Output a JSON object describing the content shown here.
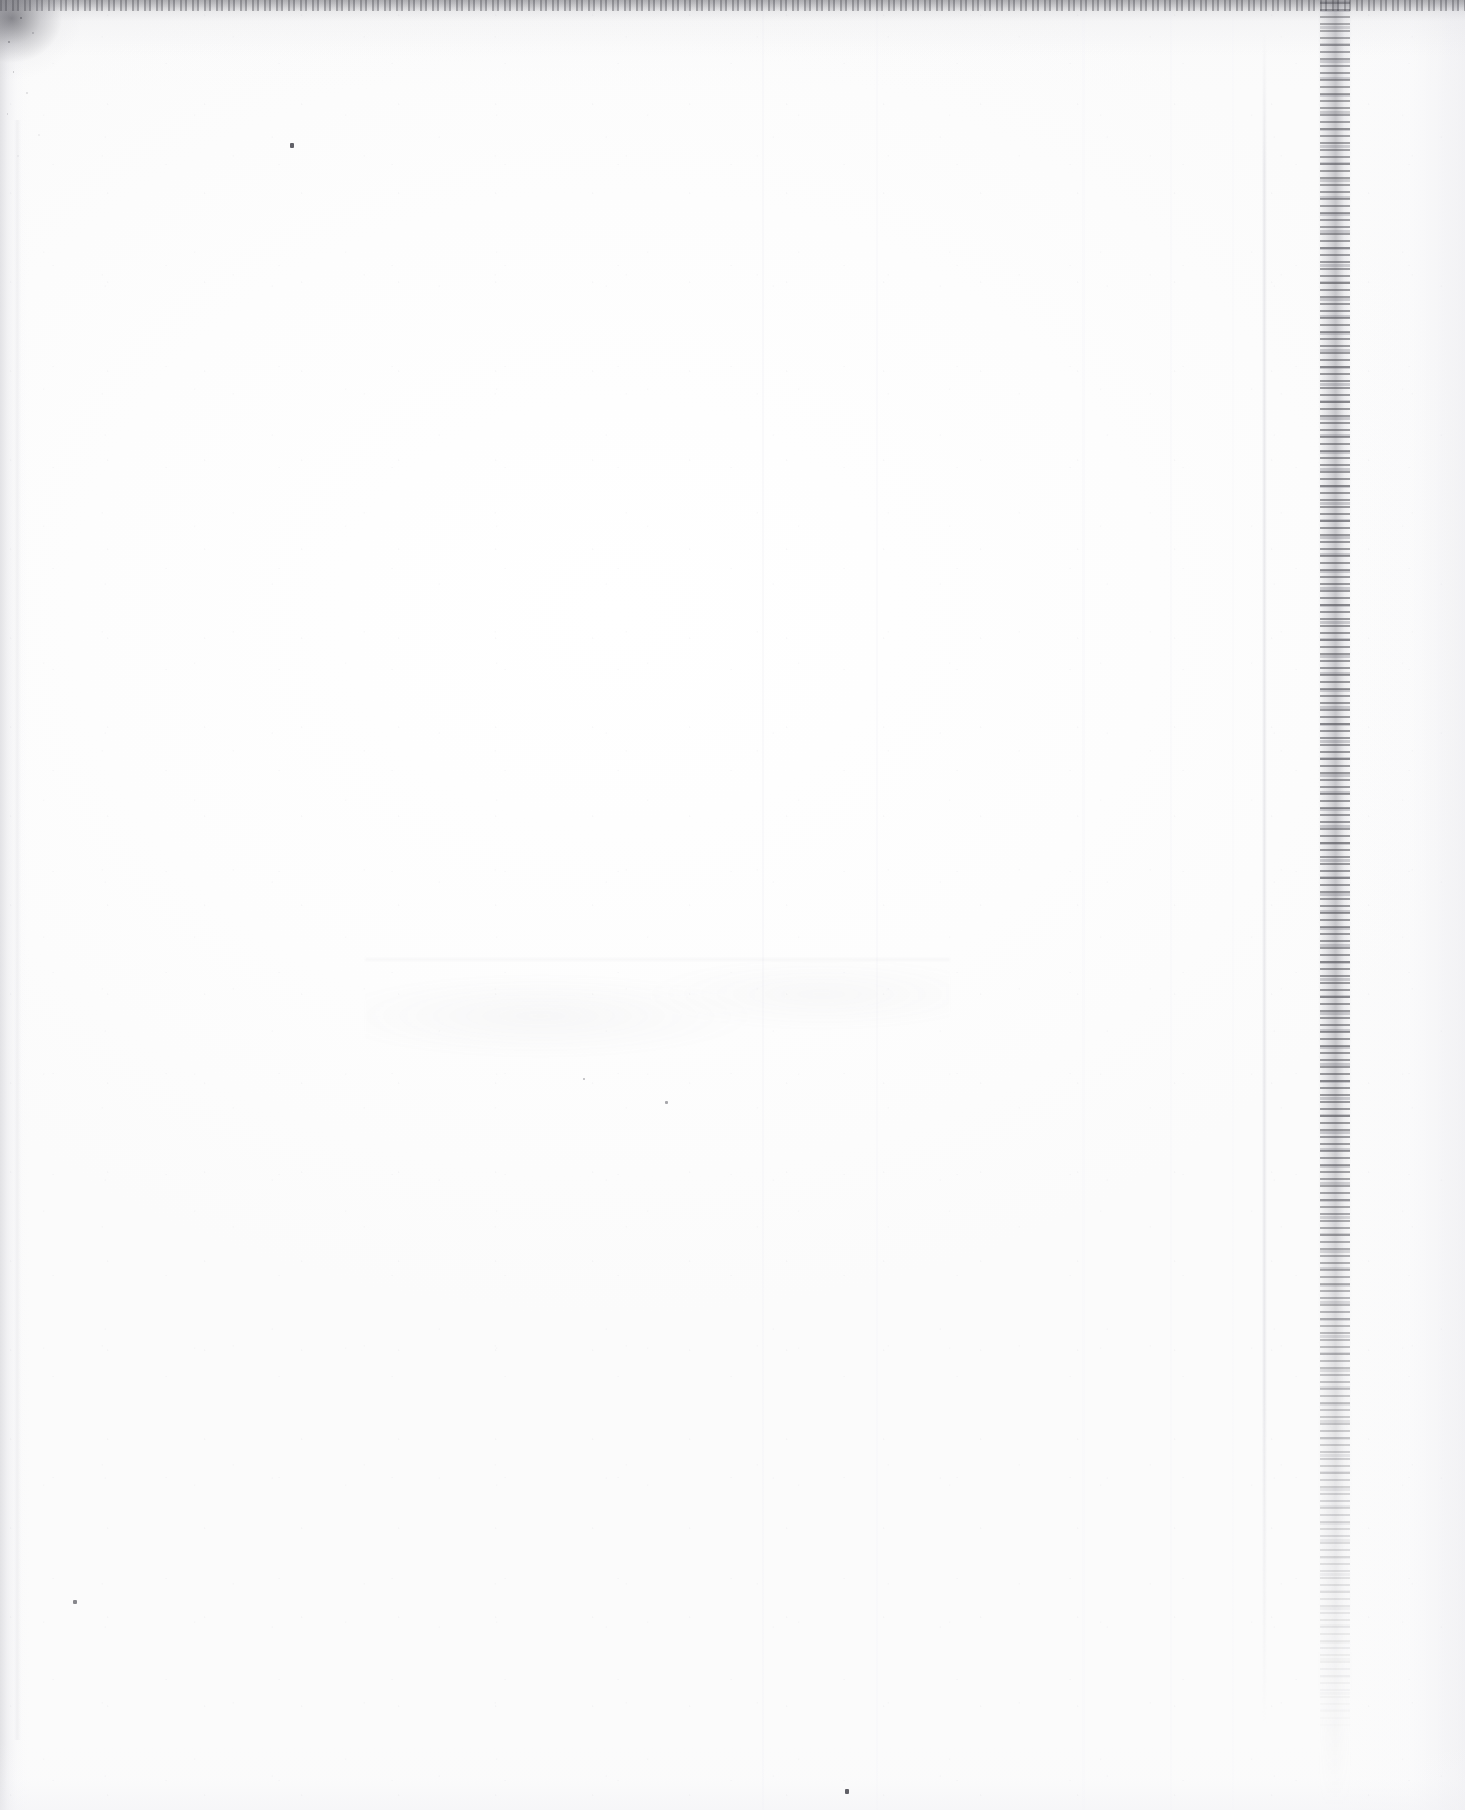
{
  "page": {
    "kind": "scanned-blank-page",
    "width_px": 1465,
    "height_px": 1810,
    "paper_color": "#fdfdfd",
    "background_color": "#ffffff"
  },
  "content": {
    "legible_text": "",
    "body_text": "",
    "heading": "",
    "page_number": "",
    "caption": "",
    "note": ""
  },
  "ghosting": {
    "top_line_1": "",
    "top_line_2": "",
    "lower_band_text": "",
    "ink_color": "#787884"
  },
  "artifacts": {
    "top_rule_color": "#5a5a60",
    "right_band_color": "#787882",
    "left_band_color": "#dbdbdf",
    "crease_color": "#d8d8de",
    "speck_color": "#3a3a42",
    "items": [
      {
        "name": "top-edge-dark-rule",
        "label": ""
      },
      {
        "name": "top-left-dark-blotch",
        "label": ""
      },
      {
        "name": "left-grey-margin-band",
        "label": ""
      },
      {
        "name": "right-dark-speckled-band",
        "label": ""
      },
      {
        "name": "vertical-crease-line",
        "label": ""
      },
      {
        "name": "bottom-edge-haze",
        "label": ""
      }
    ]
  },
  "specks": [
    {
      "name": "speck-upper-left",
      "label": ""
    },
    {
      "name": "speck-lower-left",
      "label": ""
    },
    {
      "name": "speck-bottom-mid",
      "label": ""
    },
    {
      "name": "speck-mid-a",
      "label": ""
    },
    {
      "name": "speck-mid-b",
      "label": ""
    }
  ]
}
